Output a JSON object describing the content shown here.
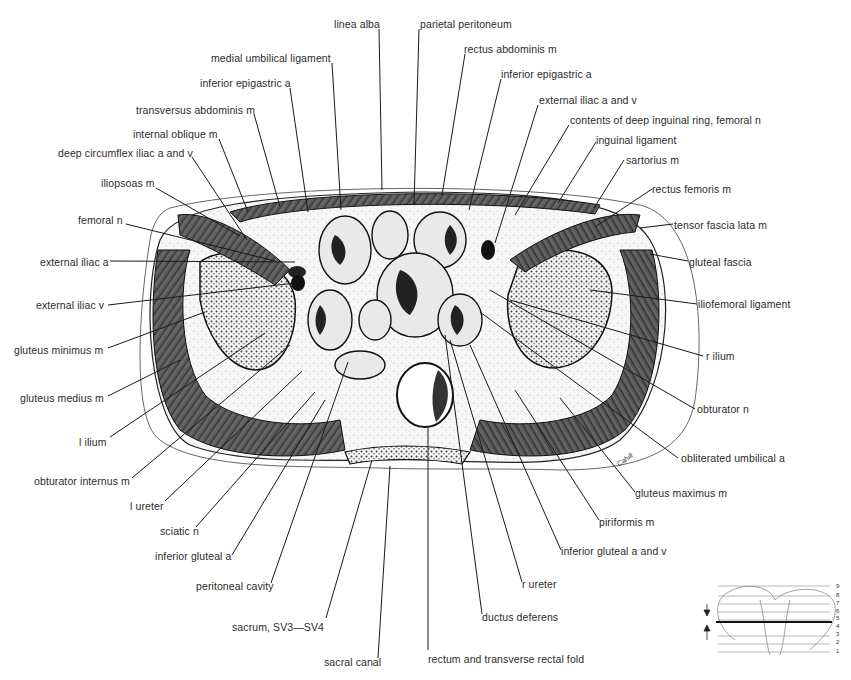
{
  "figure": {
    "signature": "Cahill",
    "labels_top": [
      {
        "id": "linea-alba",
        "text": "linea alba",
        "x": 334,
        "y": 18
      },
      {
        "id": "parietal-peritoneum",
        "text": "parietal peritoneum",
        "x": 420,
        "y": 18
      },
      {
        "id": "medial-umbilical-ligament",
        "text": "medial umbilical ligament",
        "x": 211,
        "y": 52
      },
      {
        "id": "rectus-abdominis-m",
        "text": "rectus abdominis m",
        "x": 464,
        "y": 43
      },
      {
        "id": "inferior-epigastric-a-left",
        "text": "inferior epigastric a",
        "x": 200,
        "y": 77
      },
      {
        "id": "inferior-epigastric-a-right",
        "text": "inferior epigastric a",
        "x": 501,
        "y": 68
      },
      {
        "id": "transversus-abdominis-m",
        "text": "transversus abdominis m",
        "x": 136,
        "y": 104
      },
      {
        "id": "external-iliac-a-and-v-right",
        "text": "external iliac a and v",
        "x": 539,
        "y": 94
      },
      {
        "id": "internal-oblique-m",
        "text": "internal oblique m",
        "x": 133,
        "y": 128
      },
      {
        "id": "contents-deep-inguinal-ring",
        "text": "contents of deep inguinal ring, femoral n",
        "x": 570,
        "y": 114
      },
      {
        "id": "deep-circumflex-iliac",
        "text": "deep circumflex iliac a and v",
        "x": 58,
        "y": 147
      },
      {
        "id": "inguinal-ligament",
        "text": "inguinal ligament",
        "x": 596,
        "y": 134
      },
      {
        "id": "iliopsoas-m",
        "text": "iliopsoas m",
        "x": 101,
        "y": 177
      },
      {
        "id": "sartorius-m",
        "text": "sartorius m",
        "x": 626,
        "y": 154
      },
      {
        "id": "rectus-femoris-m",
        "text": "rectus femoris m",
        "x": 652,
        "y": 183
      },
      {
        "id": "femoral-n",
        "text": "femoral n",
        "x": 78,
        "y": 214
      },
      {
        "id": "tensor-fascia-lata-m",
        "text": "tensor fascia lata m",
        "x": 674,
        "y": 219
      }
    ],
    "labels_left": [
      {
        "id": "external-iliac-a-left",
        "text": "external iliac a",
        "x": 40,
        "y": 256
      },
      {
        "id": "external-iliac-v-left",
        "text": "external iliac v",
        "x": 36,
        "y": 299
      },
      {
        "id": "gluteus-minimus-m",
        "text": "gluteus minimus m",
        "x": 14,
        "y": 344
      },
      {
        "id": "gluteus-medius-m",
        "text": "gluteus medius m",
        "x": 20,
        "y": 392
      },
      {
        "id": "l-ilium",
        "text": "l ilium",
        "x": 79,
        "y": 436
      },
      {
        "id": "obturator-internus-m",
        "text": "obturator internus m",
        "x": 34,
        "y": 475
      },
      {
        "id": "l-ureter",
        "text": "l ureter",
        "x": 130,
        "y": 500
      },
      {
        "id": "sciatic-n",
        "text": "sciatic n",
        "x": 160,
        "y": 525
      },
      {
        "id": "inferior-gluteal-a",
        "text": "inferior gluteal a",
        "x": 155,
        "y": 550
      },
      {
        "id": "peritoneal-cavity",
        "text": "peritoneal cavity",
        "x": 196,
        "y": 580
      },
      {
        "id": "sacrum-sv3-sv4",
        "text": "sacrum, SV3—SV4",
        "x": 232,
        "y": 621
      },
      {
        "id": "sacral-canal",
        "text": "sacral canal",
        "x": 324,
        "y": 656
      }
    ],
    "labels_right": [
      {
        "id": "gluteal-fascia",
        "text": "gluteal fascia",
        "x": 689,
        "y": 256
      },
      {
        "id": "iliofemoral-ligament",
        "text": "iliofemoral ligament",
        "x": 698,
        "y": 298
      },
      {
        "id": "r-ilium",
        "text": "r ilium",
        "x": 706,
        "y": 350
      },
      {
        "id": "obturator-n",
        "text": "obturator n",
        "x": 697,
        "y": 403
      },
      {
        "id": "obliterated-umbilical-a",
        "text": "obliterated umbilical a",
        "x": 681,
        "y": 452
      },
      {
        "id": "gluteus-maximus-m",
        "text": "gluteus maximus m",
        "x": 635,
        "y": 487
      },
      {
        "id": "piriformis-m",
        "text": "piriformis m",
        "x": 599,
        "y": 516
      },
      {
        "id": "inferior-gluteal-a-and-v",
        "text": "inferior gluteal a and v",
        "x": 561,
        "y": 545
      },
      {
        "id": "r-ureter",
        "text": "r ureter",
        "x": 522,
        "y": 578
      },
      {
        "id": "ductus-deferens",
        "text": "ductus deferens",
        "x": 482,
        "y": 611
      },
      {
        "id": "rectum-transverse-rectal-fold",
        "text": "rectum and transverse rectal fold",
        "x": 428,
        "y": 653
      }
    ]
  },
  "level_key": {
    "numbers": [
      "9",
      "8",
      "7",
      "6",
      "5",
      "4",
      "3",
      "2",
      "1"
    ],
    "selected_level": "4"
  }
}
